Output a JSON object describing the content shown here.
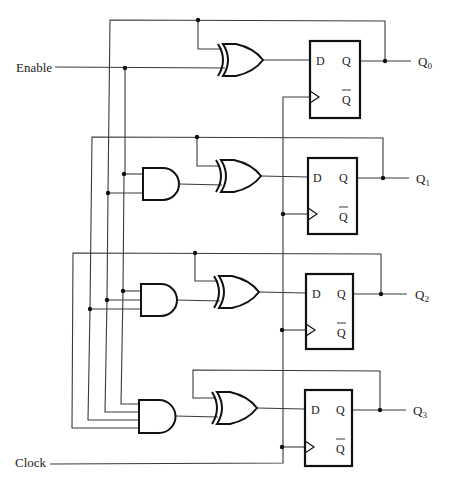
{
  "diagram": {
    "title": "",
    "type": "4-bit synchronous counter (D flip-flops with XOR/AND enable logic)",
    "inputs": {
      "enable_label": "Enable",
      "clock_label": "Clock"
    },
    "flipflop_pins": {
      "d": "D",
      "q": "Q",
      "qbar": "Q"
    },
    "outputs": [
      {
        "base": "Q",
        "sub": "0"
      },
      {
        "base": "Q",
        "sub": "1"
      },
      {
        "base": "Q",
        "sub": "2"
      },
      {
        "base": "Q",
        "sub": "3"
      }
    ],
    "stages": [
      {
        "id": 0,
        "and_gate_inputs": 0,
        "xor_gate": true
      },
      {
        "id": 1,
        "and_gate_inputs": 2,
        "xor_gate": true
      },
      {
        "id": 2,
        "and_gate_inputs": 3,
        "xor_gate": true
      },
      {
        "id": 3,
        "and_gate_inputs": 4,
        "xor_gate": true
      }
    ],
    "colors": {
      "stroke": "#111111",
      "wire": "#3a3a3a",
      "background": "#ffffff"
    }
  }
}
